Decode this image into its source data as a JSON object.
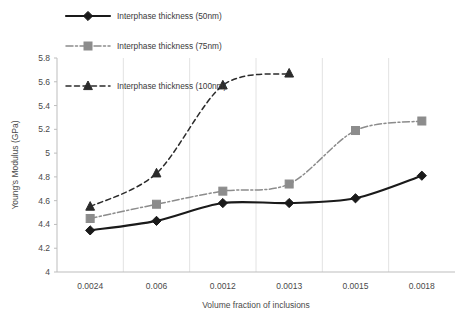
{
  "chart_data": {
    "type": "line",
    "title": "",
    "xlabel": "Volume fraction of inclusions",
    "ylabel": "Young's Modulus (GPa)",
    "categories": [
      "0.0024",
      "0.006",
      "0.0012",
      "0.0013",
      "0.0015",
      "0.0018"
    ],
    "ylim": [
      4,
      5.8
    ],
    "yticks": [
      "4",
      "4.2",
      "4.4",
      "4.6",
      "4.8",
      "5",
      "5.2",
      "5.4",
      "5.6",
      "5.8"
    ],
    "ytick_values": [
      4,
      4.2,
      4.4,
      4.6,
      4.8,
      5,
      5.2,
      5.4,
      5.6,
      5.8
    ],
    "grid": "vertical",
    "legend_position": "top-left",
    "series": [
      {
        "name": "Interphase thickness (50nm)",
        "marker": "diamond",
        "line_style": "solid",
        "color": "#1a1a1a",
        "values": [
          4.35,
          4.43,
          4.58,
          4.58,
          4.62,
          4.81
        ]
      },
      {
        "name": "Interphase thickness (75nm)",
        "marker": "square",
        "line_style": "dash-dot",
        "color": "#8c8c8c",
        "values": [
          4.45,
          4.57,
          4.68,
          4.74,
          5.19,
          5.27
        ]
      },
      {
        "name": "Interphase thickness (100nm)",
        "marker": "triangle",
        "line_style": "dashed",
        "color": "#2b2b2b",
        "values": [
          4.55,
          4.83,
          5.57,
          5.67,
          null,
          null
        ]
      }
    ]
  },
  "legend": {
    "items": [
      {
        "label": "Interphase thickness (50nm)"
      },
      {
        "label": "Interphase thickness (75nm)"
      },
      {
        "label": "Interphase thickness (100nm)"
      }
    ]
  },
  "colors": {
    "series_50nm": "#1a1a1a",
    "series_75nm": "#8c8c8c",
    "series_100nm": "#2b2b2b",
    "grid": "#e2e2e2",
    "axis": "#bdbdbd",
    "text": "#4a4a4a",
    "background": "#ffffff"
  }
}
